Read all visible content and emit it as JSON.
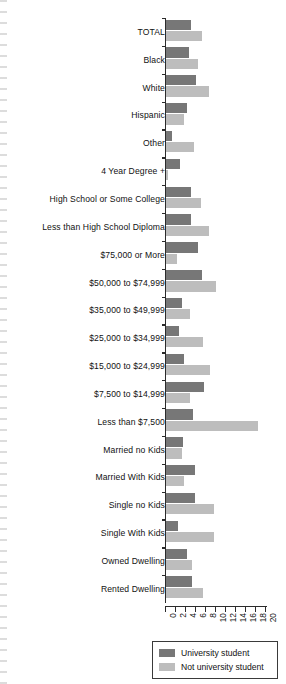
{
  "chart_data": {
    "type": "bar",
    "orientation": "horizontal",
    "title": "",
    "xlabel": "",
    "ylabel": "",
    "xlim": [
      0,
      20
    ],
    "xticks": [
      "0",
      "2",
      "4",
      "6",
      "8",
      "10",
      "12",
      "14",
      "16",
      "18",
      "20"
    ],
    "grid": false,
    "legend_position": "bottom-right",
    "categories": [
      "TOTAL",
      "Black",
      "White",
      "Hispanic",
      "Other",
      "4 Year Degree +",
      "High School or Some College",
      "Less than High School Diploma",
      "$75,000 or More",
      "$50,000 to $74,999",
      "$35,000 to $49,999",
      "$25,000 to $34,999",
      "$15,000 to $24,999",
      "$7,500 to $14,999",
      "Less than $7,500",
      "Married no Kids",
      "Married With Kids",
      "Single no Kids",
      "Single With Kids",
      "Owned Dwelling",
      "Rented Dwelling"
    ],
    "series": [
      {
        "name": "University student",
        "color": "#777777",
        "values": [
          5.0,
          4.5,
          6.0,
          4.2,
          1.2,
          2.8,
          5.0,
          4.9,
          6.3,
          7.2,
          3.1,
          2.6,
          3.6,
          7.5,
          5.4,
          3.4,
          5.8,
          5.7,
          2.4,
          4.1,
          5.2
        ]
      },
      {
        "name": "Not university student",
        "color": "#bdbdbd",
        "values": [
          7.2,
          6.3,
          8.6,
          3.6,
          5.6,
          0.4,
          7.0,
          8.6,
          2.2,
          9.9,
          4.7,
          7.4,
          8.8,
          4.8,
          18.3,
          3.1,
          3.6,
          9.5,
          9.6,
          5.2,
          7.4
        ]
      }
    ]
  },
  "legend": {
    "items": [
      {
        "label": "University student",
        "color": "#777777"
      },
      {
        "label": "Not university student",
        "color": "#bdbdbd"
      }
    ]
  }
}
